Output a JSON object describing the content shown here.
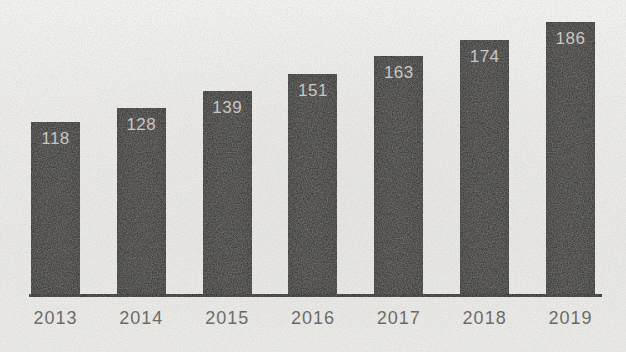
{
  "chart_data": {
    "type": "bar",
    "title": "",
    "xlabel": "",
    "ylabel": "",
    "categories": [
      "2013",
      "2014",
      "2015",
      "2016",
      "2017",
      "2018",
      "2019"
    ],
    "values": [
      118,
      128,
      139,
      151,
      163,
      174,
      186
    ],
    "ylim": [
      0,
      190
    ],
    "grid": false,
    "legend": "none",
    "value_labels": "inside-top",
    "bar_color": "#2e2d2b",
    "value_label_color": "#c9c8c4",
    "axis_label_color": "#4a4947",
    "axis_line_color": "#1f1e1c",
    "background_color": "#f4f3f0"
  }
}
